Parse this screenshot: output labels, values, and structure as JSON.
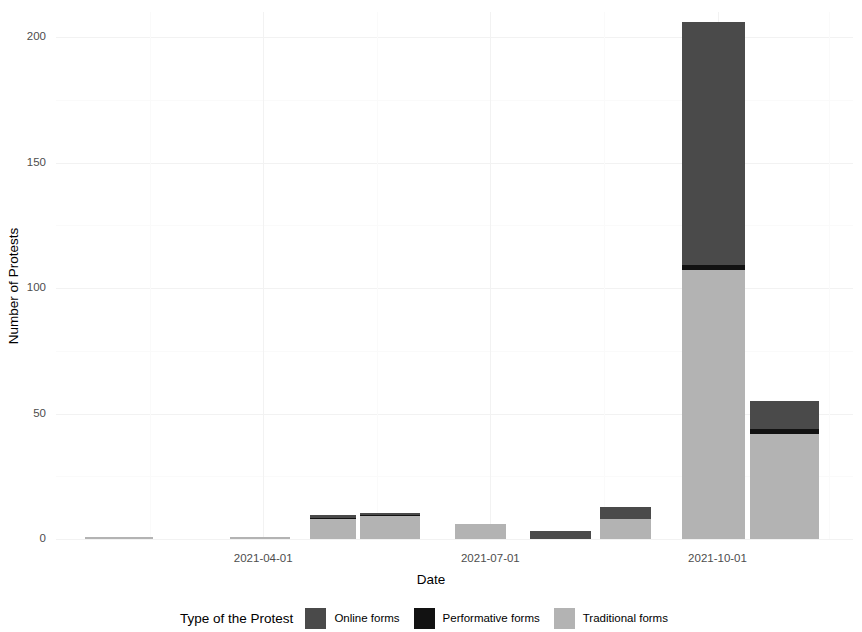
{
  "chart_data": {
    "type": "bar",
    "stacked": true,
    "title": "",
    "xlabel": "Date",
    "ylabel": "Number of Protests",
    "ylim": [
      0,
      210
    ],
    "yticks": [
      0,
      50,
      100,
      150,
      200
    ],
    "ytick_labels": [
      "0",
      "50",
      "100",
      "150",
      "200"
    ],
    "y_minor_ticks": [
      25,
      75,
      125,
      175
    ],
    "xtick_labels": [
      "2021-04-01",
      "2021-07-01",
      "2021-10-01"
    ],
    "xtick_positions": [
      0.26,
      0.545,
      0.83
    ],
    "x_minor_positions": [
      0.118,
      0.403,
      0.688,
      0.97
    ],
    "grid": true,
    "legend_position": "bottom",
    "legend_title": "Type of the Protest",
    "series": [
      {
        "name": "Online forms",
        "color": "#4a4a4a",
        "values": [
          0,
          0,
          1,
          1,
          0,
          3,
          4.6,
          97,
          11
        ]
      },
      {
        "name": "Performative forms",
        "color": "#121212",
        "values": [
          0,
          0,
          0.5,
          0.5,
          0,
          0,
          0,
          2,
          2
        ]
      },
      {
        "name": "Traditional forms",
        "color": "#b3b3b3",
        "values": [
          1,
          1,
          8,
          9,
          6,
          0,
          8,
          107,
          42
        ]
      }
    ],
    "bars": [
      {
        "label": "2021-03-01",
        "left_pct": 3.6,
        "width_pct": 8.6,
        "online": 0,
        "performative": 0,
        "traditional": 1
      },
      {
        "label": "2021-05-01",
        "left_pct": 21.8,
        "width_pct": 7.6,
        "online": 0,
        "performative": 0,
        "traditional": 1
      },
      {
        "label": "2021-06-01",
        "left_pct": 31.9,
        "width_pct": 5.7,
        "online": 1,
        "performative": 0.5,
        "traditional": 8
      },
      {
        "label": "2021-07-01",
        "left_pct": 38.1,
        "width_pct": 7.6,
        "online": 1,
        "performative": 0.5,
        "traditional": 9
      },
      {
        "label": "2021-08-01",
        "left_pct": 50.1,
        "width_pct": 6.3,
        "online": 0,
        "performative": 0,
        "traditional": 6
      },
      {
        "label": "2021-09-01",
        "left_pct": 59.5,
        "width_pct": 7.6,
        "online": 3,
        "performative": 0,
        "traditional": 0
      },
      {
        "label": "2021-10-01",
        "left_pct": 68.3,
        "width_pct": 6.3,
        "online": 4.6,
        "performative": 0,
        "traditional": 8
      },
      {
        "label": "2021-11-01",
        "left_pct": 78.5,
        "width_pct": 8.0,
        "online": 97,
        "performative": 2,
        "traditional": 107
      },
      {
        "label": "2021-12-01",
        "left_pct": 87.1,
        "width_pct": 8.6,
        "online": 11,
        "performative": 2,
        "traditional": 42
      }
    ]
  },
  "axes": {
    "y_title": "Number of Protests",
    "x_title": "Date"
  },
  "legend": {
    "title": "Type of the Protest",
    "items": [
      {
        "label": "Online forms",
        "color": "#4a4a4a"
      },
      {
        "label": "Performative forms",
        "color": "#121212"
      },
      {
        "label": "Traditional forms",
        "color": "#b3b3b3"
      }
    ]
  }
}
